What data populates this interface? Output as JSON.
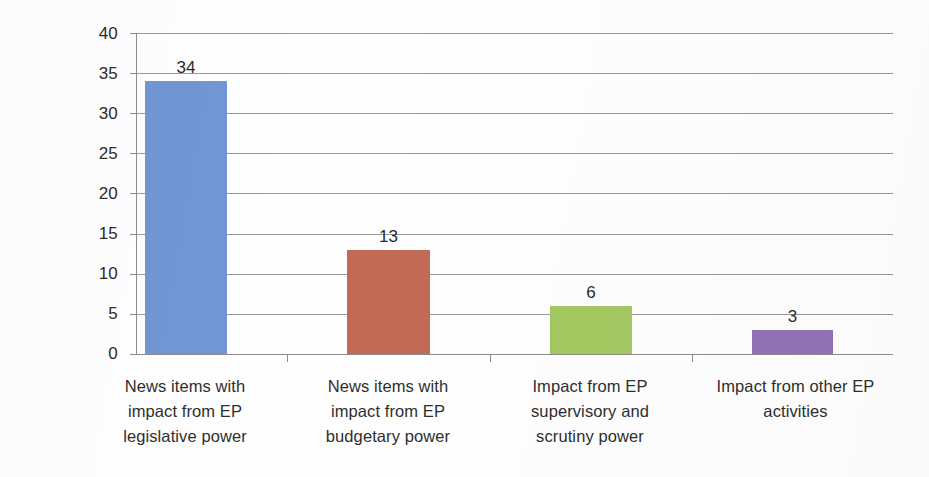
{
  "chart_data": {
    "type": "bar",
    "title": "",
    "subtitle": "",
    "xlabel": "",
    "ylabel": "",
    "ylim": [
      0,
      40
    ],
    "ytick_step": 5,
    "yticks": [
      "40",
      "35",
      "30",
      "25",
      "20",
      "15",
      "10",
      "5",
      "0"
    ],
    "grid": true,
    "legend": "none",
    "categories": [
      "News items with impact from EP legislative power",
      "News items with impact from EP budgetary power",
      "Impact from EP supervisory and scrutiny power",
      "Impact from other EP activities"
    ],
    "category_lines": [
      [
        "News items with",
        "impact from EP",
        "legislative power"
      ],
      [
        "News items with",
        "impact from EP",
        "budgetary power"
      ],
      [
        "Impact from EP",
        "supervisory and",
        "scrutiny power"
      ],
      [
        "Impact from other EP",
        "activities"
      ]
    ],
    "values": [
      34,
      13,
      6,
      3
    ],
    "value_labels": [
      "34",
      "13",
      "6",
      "3"
    ],
    "bar_colors": [
      "#7296d4",
      "#c26a54",
      "#a3c862",
      "#9172b5"
    ]
  },
  "axis": {
    "grid_color": "#9a9a9a",
    "axis_color": "#8d8d8d",
    "text_color": "#2b2b2b"
  }
}
